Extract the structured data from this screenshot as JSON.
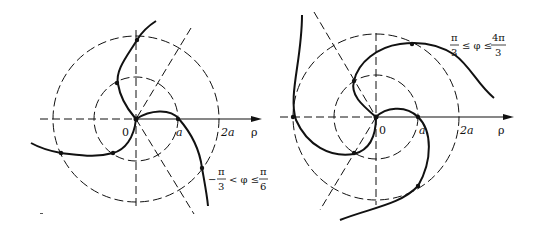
{
  "figures": [
    {
      "id": "left",
      "axis_label": "ρ",
      "origin_label": "0",
      "tick_labels": [
        "a",
        "2a"
      ],
      "range_label": {
        "left": "−",
        "num1": "π",
        "den1": "3",
        "mid": "< φ ≤",
        "num2": "π",
        "den2": "6"
      }
    },
    {
      "id": "right",
      "axis_label": "ρ",
      "origin_label": "0",
      "tick_labels": [
        "a",
        "2a"
      ],
      "range_label": {
        "num1": "π",
        "den1": "3",
        "mid": "≤ φ ≤",
        "num2": "4π",
        "den2": "3"
      }
    }
  ],
  "colors": {
    "ink": "#111111",
    "background": "#ffffff"
  }
}
